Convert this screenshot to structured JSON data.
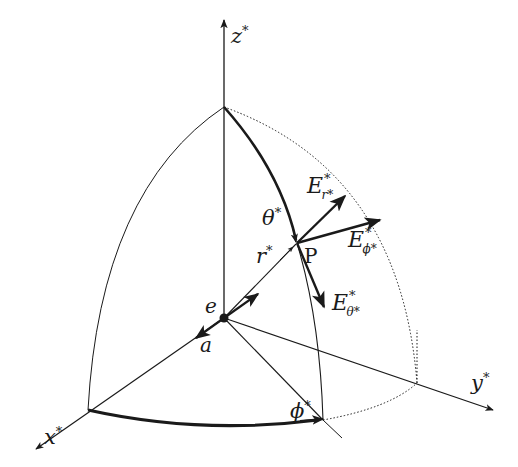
{
  "figure": {
    "labels": {
      "z_axis": "z",
      "x_axis": "x",
      "y_axis": "y",
      "star": "*",
      "theta": "θ",
      "r": "r",
      "phi": "ϕ",
      "point": "P",
      "origin": "e",
      "a": "a",
      "E": "E",
      "E_r_sub": "r*",
      "E_phi_sub": "ϕ*",
      "E_theta_sub": "θ*"
    },
    "colors": {
      "ink": "#1a1a1a",
      "background": "#ffffff"
    }
  }
}
